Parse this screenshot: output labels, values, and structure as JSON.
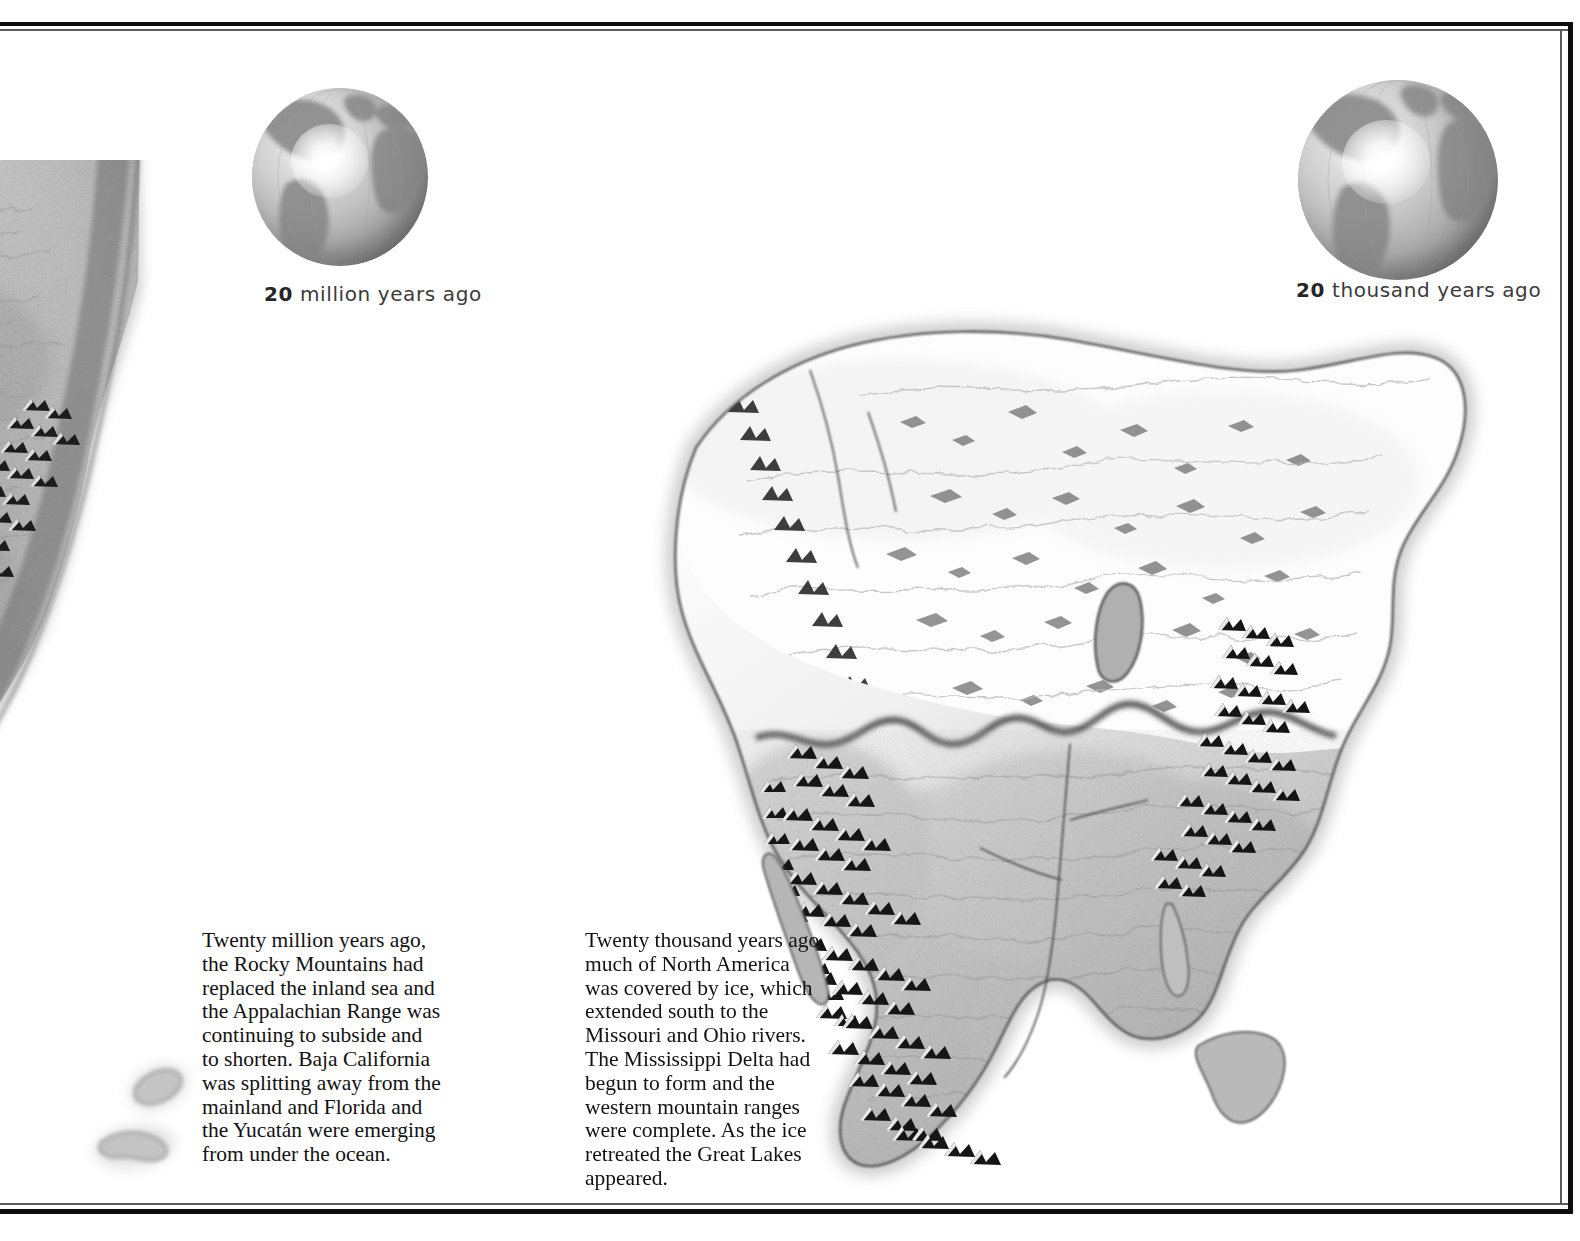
{
  "page": {
    "background_color": "#ffffff",
    "frame_color": "#0d0d0d",
    "frame_style": "double-rule"
  },
  "panels": [
    {
      "id": "left",
      "globe_caption_number": "20",
      "globe_caption_rest": " million years ago",
      "globe_caption_full": "20 million years ago",
      "map_label": "north-america-20-million-years-ago",
      "caption": "Twenty million years ago, the Rocky Mountains had replaced the inland sea and the Appalachian Range was continuing to subside and to shorten. Baja California was splitting away from the mainland and Florida and the Yucatán were emerging from under the ocean."
    },
    {
      "id": "right",
      "globe_caption_number": "20",
      "globe_caption_rest": " thousand years ago",
      "globe_caption_full": "20 thousand years ago",
      "map_label": "north-america-20-thousand-years-ago",
      "caption": "Twenty thousand years ago, much of North America was covered by ice, which extended south to the Missouri and Ohio rivers. The Mississippi Delta had begun to form and the western mountain ranges were complete. As the ice retreated the Great Lakes appeared."
    }
  ],
  "icons": {
    "globe": "globe-icon",
    "map": "map-icon"
  },
  "colors": {
    "ink": "#121212",
    "caption_ink": "#3b3b3b",
    "land_light": "#d5d5d5",
    "land_mid": "#b4b4b4",
    "land_dark": "#8d8d8d",
    "ice_white": "#fcfcfc",
    "mountain_black": "#1a1a1a",
    "globe_ocean": "#bdbdbd",
    "globe_land": "#8a8a8a"
  }
}
